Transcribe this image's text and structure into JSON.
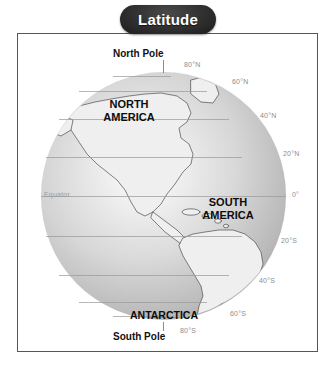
{
  "title": {
    "label": "Latitude"
  },
  "map": {
    "poles": {
      "north": "North Pole",
      "south": "South Pole"
    },
    "equator_label": "Equator",
    "continents": [
      {
        "name": "north-america",
        "label": "NORTH\nAMERICA"
      },
      {
        "name": "south-america",
        "label": "SOUTH\nAMERICA"
      },
      {
        "name": "antarctica",
        "label": "ANTARCTICA"
      }
    ],
    "latitude_lines": [
      {
        "label": "80°N",
        "value": 80
      },
      {
        "label": "60°N",
        "value": 60
      },
      {
        "label": "40°N",
        "value": 40
      },
      {
        "label": "20°N",
        "value": 20
      },
      {
        "label": "0°",
        "value": 0
      },
      {
        "label": "20°S",
        "value": -20
      },
      {
        "label": "40°S",
        "value": -40
      },
      {
        "label": "60°S",
        "value": -60
      },
      {
        "label": "80°S",
        "value": -80
      }
    ]
  },
  "colors": {
    "frame_border": "#54565a",
    "badge_background": "#2b2b2b",
    "badge_text": "#ffffff",
    "gridline": "#9a9a9a",
    "label_text": "#8d8d8d",
    "caption_text": "#0d0d0d",
    "globe_light": "#fdfdfd",
    "globe_shadow": "#a3a3a3"
  }
}
